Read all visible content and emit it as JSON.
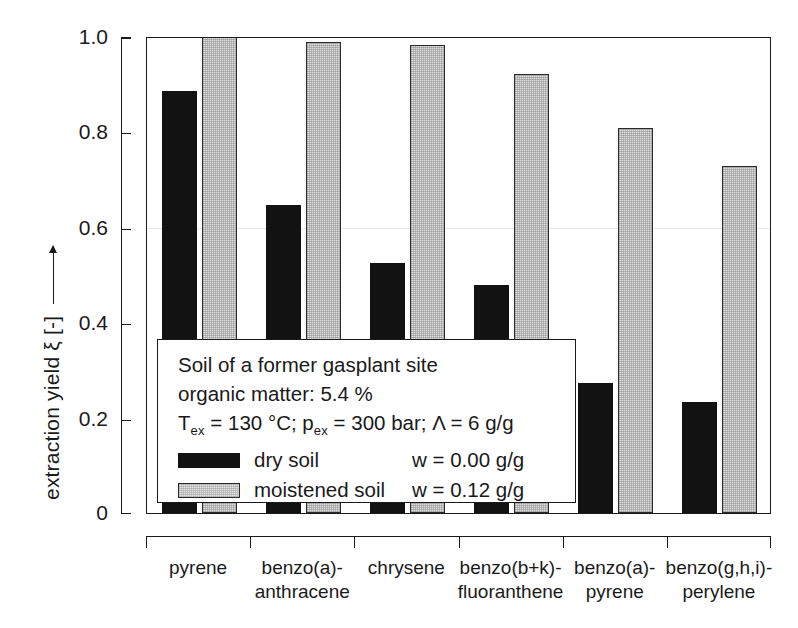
{
  "chart_data": {
    "type": "bar",
    "title": "",
    "xlabel": "",
    "ylabel": "extraction yield ξ [-]",
    "ylim": [
      0,
      1.0
    ],
    "ytick_labels": [
      "0",
      "0.2",
      "0.4",
      "0.6",
      "0.8",
      "1.0"
    ],
    "ytick_values": [
      0,
      0.2,
      0.4,
      0.6,
      0.8,
      1.0
    ],
    "grid": "faint horizontal gridline at 0.6",
    "legend_position": "inside lower-left",
    "categories": [
      "pyrene",
      "benzo(a)-\nanthracene",
      "chrysene",
      "benzo(b+k)-\nfluoranthene",
      "benzo(a)-\npyrene",
      "benzo(g,h,i)-\nperylene"
    ],
    "categories_display": [
      [
        "pyrene",
        ""
      ],
      [
        "benzo(a)-",
        "anthracene"
      ],
      [
        "chrysene",
        ""
      ],
      [
        "benzo(b+k)-",
        "fluoranthene"
      ],
      [
        "benzo(a)-",
        "pyrene"
      ],
      [
        "benzo(g,h,i)-",
        "perylene"
      ]
    ],
    "series": [
      {
        "name": "dry soil",
        "color": "#121212",
        "values": [
          0.885,
          0.645,
          0.525,
          0.477,
          0.272,
          0.232
        ]
      },
      {
        "name": "moistened soil",
        "color": "#e0e0e0",
        "values": [
          1.0,
          0.988,
          0.982,
          0.92,
          0.808,
          0.727
        ]
      }
    ]
  },
  "yaxis": {
    "label_text": "extraction yield ξ [-]",
    "ticks": [
      "1.0",
      "0.8",
      "0.6",
      "0.4",
      "0.2",
      "0"
    ]
  },
  "legend": {
    "line1": "Soil of a former gasplant site",
    "line2": "organic matter:  5.4 %",
    "line3_a": "T",
    "line3_sub_a": "ex",
    "line3_b": " = 130 °C; p",
    "line3_sub_b": "ex",
    "line3_c": " = 300 bar; Λ = 6 g/g",
    "row1_label": "dry soil",
    "row1_value": "w = 0.00 g/g",
    "row2_label": "moistened soil",
    "row2_value": "w = 0.12 g/g"
  }
}
